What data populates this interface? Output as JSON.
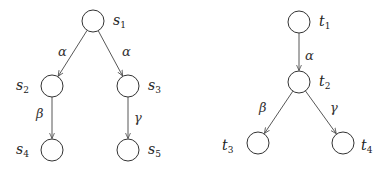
{
  "diagrams": [
    {
      "name": "left-tree",
      "nodes": [
        {
          "id": "s1",
          "base": "s",
          "sub": "1"
        },
        {
          "id": "s2",
          "base": "s",
          "sub": "2"
        },
        {
          "id": "s3",
          "base": "s",
          "sub": "3"
        },
        {
          "id": "s4",
          "base": "s",
          "sub": "4"
        },
        {
          "id": "s5",
          "base": "s",
          "sub": "5"
        }
      ],
      "edges": [
        {
          "from": "s1",
          "to": "s2",
          "label": "α"
        },
        {
          "from": "s1",
          "to": "s3",
          "label": "α"
        },
        {
          "from": "s2",
          "to": "s4",
          "label": "β"
        },
        {
          "from": "s3",
          "to": "s5",
          "label": "γ"
        }
      ]
    },
    {
      "name": "right-tree",
      "nodes": [
        {
          "id": "t1",
          "base": "t",
          "sub": "1"
        },
        {
          "id": "t2",
          "base": "t",
          "sub": "2"
        },
        {
          "id": "t3",
          "base": "t",
          "sub": "3"
        },
        {
          "id": "t4",
          "base": "t",
          "sub": "4"
        }
      ],
      "edges": [
        {
          "from": "t1",
          "to": "t2",
          "label": "α"
        },
        {
          "from": "t2",
          "to": "t3",
          "label": "β"
        },
        {
          "from": "t2",
          "to": "t4",
          "label": "γ"
        }
      ]
    }
  ]
}
